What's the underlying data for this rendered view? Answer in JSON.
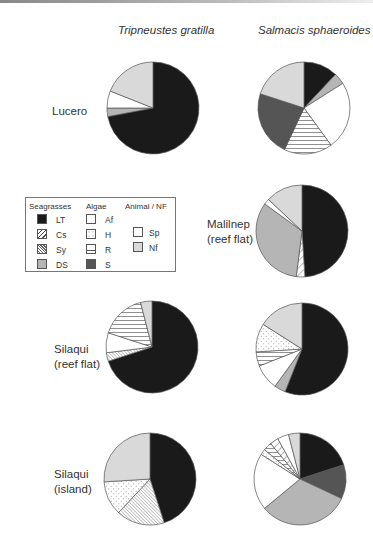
{
  "chart_data": {
    "type": "pie",
    "columns": [
      "Tripneustes gratilla",
      "Salmacis sphaeroides"
    ],
    "rows": [
      "Lucero",
      "Malilnep (reef flat)",
      "Silaqui (reef flat)",
      "Silaqui (island)"
    ],
    "legend": {
      "groups": [
        {
          "title": "Seagrasses",
          "items": [
            {
              "code": "LT",
              "fill": "#1a1a1a",
              "pattern": "solid"
            },
            {
              "code": "Cs",
              "fill": "#ffffff",
              "pattern": "diag-wide"
            },
            {
              "code": "Sy",
              "fill": "#ffffff",
              "pattern": "diag-dense"
            },
            {
              "code": "DS",
              "fill": "#b5b5b5",
              "pattern": "solid"
            }
          ]
        },
        {
          "title": "Algae",
          "items": [
            {
              "code": "Af",
              "fill": "#ffffff",
              "pattern": "solid"
            },
            {
              "code": "H",
              "fill": "#ffffff",
              "pattern": "dots"
            },
            {
              "code": "R",
              "fill": "#ffffff",
              "pattern": "horizontal"
            },
            {
              "code": "S",
              "fill": "#555555",
              "pattern": "solid"
            }
          ]
        },
        {
          "title": "Animal / NF",
          "items": [
            {
              "code": "Sp",
              "fill": "#ffffff",
              "pattern": "solid"
            },
            {
              "code": "Nf",
              "fill": "#d9d9d9",
              "pattern": "solid"
            }
          ]
        }
      ]
    },
    "pies": [
      {
        "site": "Lucero",
        "species": "Tripneustes gratilla",
        "slices": [
          {
            "cat": "LT",
            "value": 72
          },
          {
            "cat": "DS",
            "value": 3
          },
          {
            "cat": "Af",
            "value": 6
          },
          {
            "cat": "Nf",
            "value": 19
          }
        ]
      },
      {
        "site": "Lucero",
        "species": "Salmacis sphaeroides",
        "slices": [
          {
            "cat": "LT",
            "value": 12
          },
          {
            "cat": "DS",
            "value": 4
          },
          {
            "cat": "Af",
            "value": 24
          },
          {
            "cat": "R",
            "value": 17
          },
          {
            "cat": "S",
            "value": 23
          },
          {
            "cat": "Nf",
            "value": 20
          }
        ]
      },
      {
        "site": "Malilnep (reef flat)",
        "species": "Salmacis sphaeroides",
        "slices": [
          {
            "cat": "LT",
            "value": 49
          },
          {
            "cat": "Cs",
            "value": 3
          },
          {
            "cat": "DS",
            "value": 33
          },
          {
            "cat": "Af",
            "value": 2
          },
          {
            "cat": "Nf",
            "value": 13
          }
        ]
      },
      {
        "site": "Silaqui (reef flat)",
        "species": "Tripneustes gratilla",
        "slices": [
          {
            "cat": "LT",
            "value": 70
          },
          {
            "cat": "Sy",
            "value": 3
          },
          {
            "cat": "Af",
            "value": 7
          },
          {
            "cat": "R",
            "value": 16
          },
          {
            "cat": "Nf",
            "value": 4
          }
        ]
      },
      {
        "site": "Silaqui (reef flat)",
        "species": "Salmacis sphaeroides",
        "slices": [
          {
            "cat": "LT",
            "value": 56
          },
          {
            "cat": "DS",
            "value": 4
          },
          {
            "cat": "Af",
            "value": 9
          },
          {
            "cat": "R",
            "value": 5
          },
          {
            "cat": "H",
            "value": 10
          },
          {
            "cat": "Nf",
            "value": 16
          }
        ]
      },
      {
        "site": "Silaqui (island)",
        "species": "Tripneustes gratilla",
        "slices": [
          {
            "cat": "LT",
            "value": 45
          },
          {
            "cat": "Sy",
            "value": 17
          },
          {
            "cat": "H",
            "value": 12
          },
          {
            "cat": "Nf",
            "value": 26
          }
        ]
      },
      {
        "site": "Silaqui (island)",
        "species": "Salmacis sphaeroides",
        "slices": [
          {
            "cat": "LT",
            "value": 20
          },
          {
            "cat": "S",
            "value": 12
          },
          {
            "cat": "DS",
            "value": 32
          },
          {
            "cat": "Af",
            "value": 20
          },
          {
            "cat": "H",
            "value": 2
          },
          {
            "cat": "R",
            "value": 3
          },
          {
            "cat": "Cs",
            "value": 3
          },
          {
            "cat": "Sp",
            "value": 4
          },
          {
            "cat": "Nf",
            "value": 4
          }
        ]
      }
    ]
  },
  "titles": {
    "col1": "Tripneustes gratilla",
    "col2": "Salmacis sphaeroides"
  },
  "sites": {
    "lucero": "Lucero",
    "malilnep_1": "Malilnep",
    "malilnep_2": "(reef flat)",
    "silaqui_rf_1": "Silaqui",
    "silaqui_rf_2": "(reef flat)",
    "silaqui_is_1": "Silaqui",
    "silaqui_is_2": "(island)"
  },
  "legend": {
    "seagrasses": "Seagrasses",
    "algae": "Algae",
    "animal": "Animal / NF",
    "LT": "LT",
    "Cs": "Cs",
    "Sy": "Sy",
    "DS": "DS",
    "Af": "Af",
    "H": "H",
    "R": "R",
    "S": "S",
    "Sp": "Sp",
    "Nf": "Nf"
  }
}
